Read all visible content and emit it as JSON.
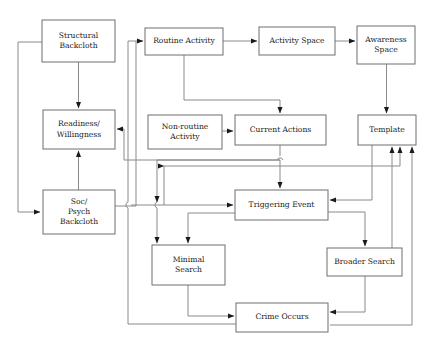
{
  "diagram": {
    "type": "flowchart",
    "canvas": {
      "width": 431,
      "height": 349
    },
    "style": {
      "box_fill": "#ffffff",
      "box_stroke": "#6e6e6e",
      "edge_stroke": "#8a8a8a",
      "text_color": "#1a1a1a",
      "background": "#ffffff"
    },
    "nodes": [
      {
        "id": "structural_backcloth",
        "label": "Structural Backcloth",
        "lines": [
          "Structural",
          "Backcloth"
        ],
        "x": 42,
        "y": 20,
        "w": 73,
        "h": 42
      },
      {
        "id": "readiness_willingness",
        "label": "Readiness/ Willingness",
        "lines": [
          "Readiness/",
          "Willingness"
        ],
        "x": 43,
        "y": 110,
        "w": 72,
        "h": 39
      },
      {
        "id": "soc_psych_backcloth",
        "label": "Soc/ Psych Backcloth",
        "lines": [
          "Soc/",
          "Psych",
          "Backcloth"
        ],
        "x": 43,
        "y": 190,
        "w": 72,
        "h": 44
      },
      {
        "id": "routine_activity",
        "label": "Routine Activity",
        "lines": [
          "Routine Activity"
        ],
        "x": 145,
        "y": 28,
        "w": 78,
        "h": 27
      },
      {
        "id": "activity_space",
        "label": "Activity Space",
        "lines": [
          "Activity Space"
        ],
        "x": 259,
        "y": 27,
        "w": 76,
        "h": 28
      },
      {
        "id": "awareness_space",
        "label": "Awareness Space",
        "lines": [
          "Awareness",
          "Space"
        ],
        "x": 357,
        "y": 26,
        "w": 58,
        "h": 38
      },
      {
        "id": "non_routine_activity",
        "label": "Non-routine Activity",
        "lines": [
          "Non-routine",
          "Activity"
        ],
        "x": 148,
        "y": 115,
        "w": 74,
        "h": 34
      },
      {
        "id": "current_actions",
        "label": "Current Actions",
        "lines": [
          "Current Actions"
        ],
        "x": 235,
        "y": 115,
        "w": 91,
        "h": 30
      },
      {
        "id": "template",
        "label": "Template",
        "lines": [
          "Template"
        ],
        "x": 358,
        "y": 115,
        "w": 58,
        "h": 30
      },
      {
        "id": "triggering_event",
        "label": "Triggering Event",
        "lines": [
          "Triggering Event"
        ],
        "x": 235,
        "y": 190,
        "w": 93,
        "h": 30
      },
      {
        "id": "minimal_search",
        "label": "Minimal Search",
        "lines": [
          "Minimal",
          "Search"
        ],
        "x": 152,
        "y": 245,
        "w": 73,
        "h": 40
      },
      {
        "id": "broader_search",
        "label": "Broader Search",
        "lines": [
          "Broader Search"
        ],
        "x": 327,
        "y": 248,
        "w": 75,
        "h": 28
      },
      {
        "id": "crime_occurs",
        "label": "Crime Occurs",
        "lines": [
          "Crime Occurs"
        ],
        "x": 236,
        "y": 303,
        "w": 92,
        "h": 29
      }
    ],
    "edges": [
      {
        "from": "structural_backcloth",
        "to": "readiness_willingness"
      },
      {
        "from": "structural_backcloth",
        "to": "soc_psych_backcloth"
      },
      {
        "from": "soc_psych_backcloth",
        "to": "readiness_willingness"
      },
      {
        "from": "readiness_willingness",
        "to": "routine_activity"
      },
      {
        "from": "soc_psych_backcloth",
        "to": "routine_activity"
      },
      {
        "from": "routine_activity",
        "to": "activity_space"
      },
      {
        "from": "activity_space",
        "to": "awareness_space"
      },
      {
        "from": "awareness_space",
        "to": "template"
      },
      {
        "from": "routine_activity",
        "to": "current_actions"
      },
      {
        "from": "non_routine_activity",
        "to": "current_actions"
      },
      {
        "from": "current_actions",
        "to": "triggering_event"
      },
      {
        "from": "current_actions",
        "to": "readiness_willingness"
      },
      {
        "from": "current_actions",
        "to": "minimal_search"
      },
      {
        "from": "triggering_event",
        "to": "minimal_search"
      },
      {
        "from": "triggering_event",
        "to": "broader_search"
      },
      {
        "from": "template",
        "to": "triggering_event"
      },
      {
        "from": "minimal_search",
        "to": "crime_occurs"
      },
      {
        "from": "broader_search",
        "to": "crime_occurs"
      },
      {
        "from": "crime_occurs",
        "to": "template"
      },
      {
        "from": "crime_occurs",
        "to": "routine_activity"
      },
      {
        "from": "broader_search",
        "to": "template"
      },
      {
        "from": "triggering_event",
        "to": "template"
      }
    ]
  }
}
